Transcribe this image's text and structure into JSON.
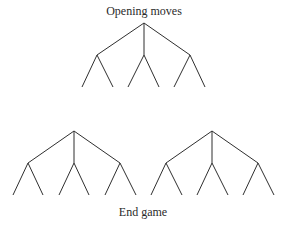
{
  "diagram": {
    "top_label": "Opening moves",
    "bottom_label": "End game",
    "line_color": "#2f2f2f",
    "trees": [
      {
        "name": "opening-tree",
        "root": [
          144,
          23
        ],
        "children": [
          [
            97,
            55
          ],
          [
            144,
            55
          ],
          [
            190,
            55
          ]
        ],
        "leaves": [
          [
            [
              82,
              87
            ],
            [
              113,
              87
            ]
          ],
          [
            [
              128,
              87
            ],
            [
              159,
              87
            ]
          ],
          [
            [
              174,
              87
            ],
            [
              205,
              87
            ]
          ]
        ]
      },
      {
        "name": "endgame-tree-left",
        "root": [
          74,
          131
        ],
        "children": [
          [
            28,
            163
          ],
          [
            74,
            163
          ],
          [
            120,
            163
          ]
        ],
        "leaves": [
          [
            [
              13,
              195
            ],
            [
              43,
              195
            ]
          ],
          [
            [
              59,
              195
            ],
            [
              89,
              195
            ]
          ],
          [
            [
              105,
              195
            ],
            [
              136,
              195
            ]
          ]
        ]
      },
      {
        "name": "endgame-tree-right",
        "root": [
          212,
          131
        ],
        "children": [
          [
            166,
            163
          ],
          [
            212,
            163
          ],
          [
            258,
            163
          ]
        ],
        "leaves": [
          [
            [
              151,
              195
            ],
            [
              182,
              195
            ]
          ],
          [
            [
              197,
              195
            ],
            [
              228,
              195
            ]
          ],
          [
            [
              243,
              195
            ],
            [
              274,
              195
            ]
          ]
        ]
      }
    ]
  }
}
